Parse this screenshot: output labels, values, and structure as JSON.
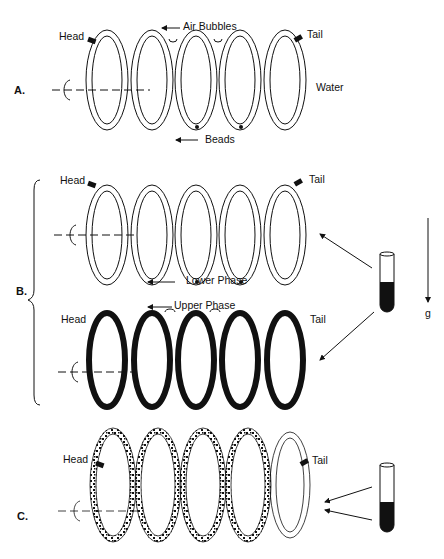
{
  "panels": {
    "A": {
      "label": "A.",
      "head": "Head",
      "tail": "Tail",
      "air_bubbles": "Air Bubbles",
      "beads": "Beads",
      "water": "Water"
    },
    "B": {
      "label": "B.",
      "top_head": "Head",
      "top_tail": "Tail",
      "lower_phase": "Lower Phase",
      "upper_phase": "Upper Phase",
      "bottom_head": "Head",
      "bottom_tail": "Tail",
      "gravity": "g"
    },
    "C": {
      "label": "C.",
      "head": "Head",
      "tail": "Tail"
    }
  },
  "colors": {
    "ink": "#111111",
    "background": "#ffffff"
  }
}
